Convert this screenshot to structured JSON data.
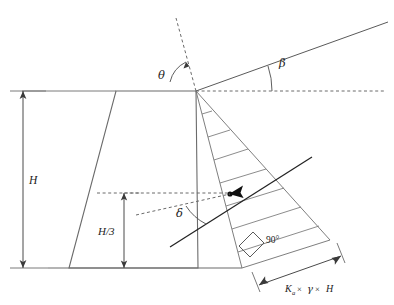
{
  "figure": {
    "kind": "retaining-wall-earth-pressure-diagram",
    "background_color": "#ffffff",
    "line_color": "#5a5a5a",
    "text_color": "#1d1d1d"
  },
  "labels": {
    "height": "H",
    "third_height": "H/3",
    "wall_batter_angle": "θ",
    "backfill_slope_angle": "β",
    "wall_friction_angle": "δ",
    "right_angle": "90°",
    "pressure_resultant": {
      "coefficient": "K",
      "coefficient_subscript": "a",
      "times_1": "×",
      "unit_weight": "γ",
      "times_2": "×",
      "wall_height": "H"
    }
  },
  "geometry": {
    "wall": {
      "top_left": [
        116,
        91
      ],
      "top_right": [
        196,
        91
      ],
      "bottom_right": [
        198,
        268
      ],
      "bottom_left": [
        69,
        268
      ]
    },
    "ground_line": {
      "x1": 48,
      "y1": 268,
      "x2": 232,
      "y2": 268
    },
    "top_ground_line": {
      "x1": 22,
      "y1": 91,
      "x2": 116,
      "y2": 91
    },
    "backfill_slope": {
      "x1": 196,
      "y1": 91,
      "x2": 388,
      "y2": 22
    },
    "horizontal_dashed": {
      "x1": 196,
      "y1": 91,
      "x2": 385,
      "y2": 91
    },
    "vertical_dashed": {
      "x1": 196,
      "y1": 91,
      "x2": 178,
      "y2": 20
    },
    "pressure_triangle": {
      "apex": [
        196,
        91
      ],
      "wall_base": [
        242,
        268
      ],
      "outer": [
        330,
        240
      ]
    },
    "failure_plane": {
      "x1": 196,
      "y1": 91,
      "x2": 330,
      "y2": 240
    },
    "resultant_point": [
      230,
      194
    ],
    "force_arrow": {
      "x1": 170,
      "y1": 246,
      "x2": 310,
      "y2": 158
    },
    "right_angle_marker": [
      250,
      243
    ],
    "dimension_H": {
      "x": 23,
      "y_top": 91,
      "y_bottom": 268
    },
    "dimension_H3": {
      "x": 124,
      "y_top": 193,
      "y_bottom": 268
    },
    "pressure_dimension": {
      "x1": 258,
      "y1": 288,
      "x2": 338,
      "y2": 258
    },
    "hatch_count": 7
  }
}
